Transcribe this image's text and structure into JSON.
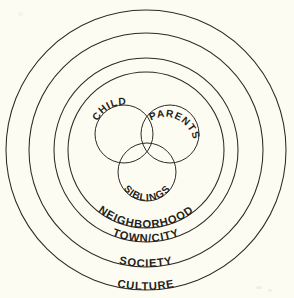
{
  "diagram": {
    "type": "nested-concentric-venn",
    "background_color": "#fdfcf3",
    "ink_color": "#2e2a24",
    "center": {
      "x": 146,
      "y": 150
    },
    "rings": [
      {
        "id": "culture",
        "label": "CULTURE",
        "radius": 140,
        "label_angle_deg": 90
      },
      {
        "id": "society",
        "label": "SOCIETY",
        "radius": 117,
        "label_angle_deg": 90
      },
      {
        "id": "town-city",
        "label": "TOWN/CITY",
        "radius": 92,
        "label_angle_deg": 90
      },
      {
        "id": "neighborhood",
        "label": "NEIGHBORHOOD",
        "radius": 78,
        "label_angle_deg": 90
      }
    ],
    "venn_circles": [
      {
        "id": "child",
        "label": "CHILD",
        "cx": 124,
        "cy": 134,
        "r": 29,
        "label_angle_deg": 205
      },
      {
        "id": "parents",
        "label": "PARENTS",
        "cx": 170,
        "cy": 134,
        "r": 29,
        "label_angle_deg": 300
      },
      {
        "id": "siblings",
        "label": "SIBLINGS",
        "cx": 147,
        "cy": 172,
        "r": 29,
        "label_angle_deg": 90
      }
    ]
  }
}
